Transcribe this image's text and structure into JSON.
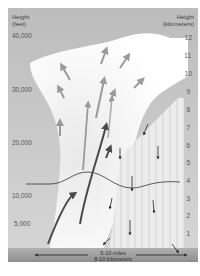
{
  "diagram": {
    "left_axis": {
      "title_line1": "Height",
      "title_line2": "(feet)",
      "ticks": [
        {
          "label": "40,000",
          "y": 36
        },
        {
          "label": "30,000",
          "y": 90
        },
        {
          "label": "20,000",
          "y": 143
        },
        {
          "label": "10,000",
          "y": 196
        },
        {
          "label": "5,000",
          "y": 224
        }
      ]
    },
    "right_axis": {
      "title_line1": "Height",
      "title_line2": "(kilometers)",
      "ticks": [
        {
          "label": "12",
          "y": 38
        },
        {
          "label": "11",
          "y": 56
        },
        {
          "label": "10",
          "y": 74
        },
        {
          "label": "9",
          "y": 92
        },
        {
          "label": "8",
          "y": 110
        },
        {
          "label": "7",
          "y": 128
        },
        {
          "label": "6",
          "y": 146
        },
        {
          "label": "5",
          "y": 163
        },
        {
          "label": "4",
          "y": 181
        },
        {
          "label": "3",
          "y": 199
        },
        {
          "label": "2",
          "y": 216
        },
        {
          "label": "1",
          "y": 234
        }
      ]
    },
    "scale_bar": {
      "line1": "5-10 miles",
      "line2": "8-10 kilometers"
    },
    "colors": {
      "background_sky": "#bdbdbd",
      "cloud": "#ffffff",
      "updraft_strong": "#555555",
      "updraft_light": "#999999",
      "downdraft": "#222222",
      "rain_shaft": "#e0e0e0",
      "ground": "#9e9e9e"
    }
  }
}
